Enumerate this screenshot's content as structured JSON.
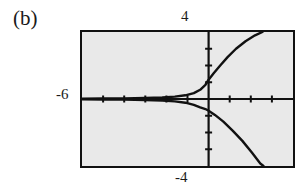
{
  "figure": {
    "panel_label": "(b)",
    "background_color": "#ffffff"
  },
  "screen": {
    "background_color": "#e9e9e9",
    "border_color": "#111111",
    "frame": {
      "left": 80,
      "top": 30,
      "width": 215,
      "height": 138
    }
  },
  "labels": {
    "ymax": "4",
    "ymin": "-4",
    "xmin": "-6",
    "xmax": ""
  },
  "chart_data": {
    "type": "line",
    "title": "(b)",
    "xlabel": "",
    "ylabel": "",
    "xlim": [
      -6,
      4
    ],
    "ylim": [
      -4,
      4
    ],
    "grid": false,
    "legend": "none",
    "axes": {
      "x_axis_at_y": 0,
      "y_axis_at_x": 0,
      "x_tick_step": 1,
      "y_tick_step": 1,
      "x_ticks": [
        -5,
        -4,
        -3,
        -2,
        -1,
        1,
        2,
        3
      ],
      "y_ticks": [
        -3,
        -2,
        -1,
        1,
        2,
        3
      ]
    },
    "tick_labels": {
      "ymax": "4",
      "ymin": "-4",
      "xmin": "-6",
      "xmax": ""
    },
    "series": [
      {
        "name": "upper-branch",
        "color": "#111111",
        "x": [
          -6.0,
          -5.0,
          -4.0,
          -3.0,
          -2.2,
          -1.6,
          -1.1,
          -0.7,
          -0.4,
          -0.15,
          0.0,
          0.25,
          0.55,
          0.9,
          1.3,
          1.75,
          2.2,
          2.55
        ],
        "y": [
          0.02,
          0.03,
          0.04,
          0.06,
          0.09,
          0.14,
          0.22,
          0.35,
          0.55,
          0.85,
          1.15,
          1.55,
          2.0,
          2.5,
          3.0,
          3.45,
          3.8,
          4.0
        ]
      },
      {
        "name": "lower-branch",
        "color": "#111111",
        "x": [
          -6.0,
          -5.0,
          -4.0,
          -3.0,
          -2.2,
          -1.6,
          -1.1,
          -0.7,
          -0.4,
          -0.15,
          0.0,
          0.3,
          0.7,
          1.15,
          1.6,
          2.05,
          2.45,
          2.6
        ],
        "y": [
          -0.02,
          -0.03,
          -0.04,
          -0.06,
          -0.09,
          -0.14,
          -0.22,
          -0.35,
          -0.5,
          -0.6,
          -0.7,
          -0.95,
          -1.35,
          -1.9,
          -2.5,
          -3.2,
          -3.85,
          -4.0
        ]
      }
    ],
    "annotations": [
      {
        "text": "(b)",
        "position": "outside-top-left"
      }
    ]
  }
}
